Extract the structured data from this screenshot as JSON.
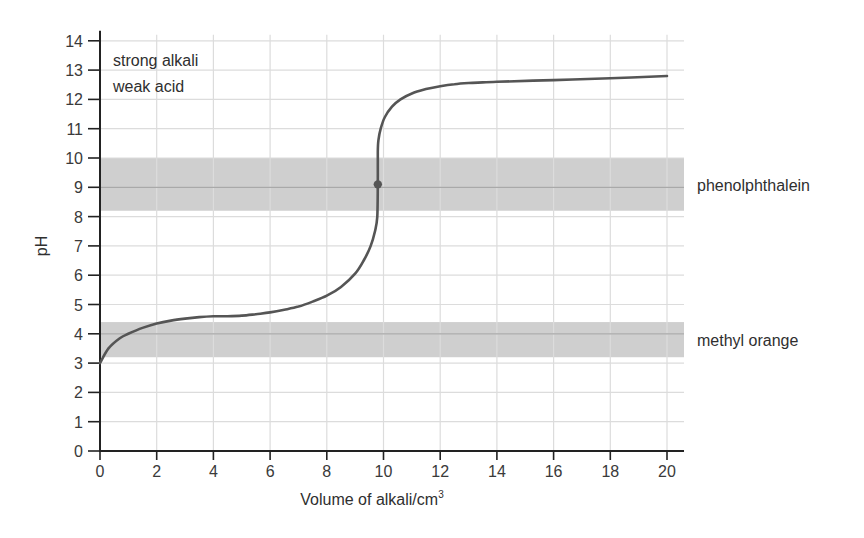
{
  "chart_data": {
    "type": "line",
    "title": "",
    "xlabel": "Volume of alkali/cm",
    "xlabel_superscript": "3",
    "ylabel": "pH",
    "xlim": [
      0,
      20.6
    ],
    "ylim": [
      0,
      14
    ],
    "grid": true,
    "x_ticks": [
      0,
      2,
      4,
      6,
      8,
      10,
      12,
      14,
      16,
      18,
      20
    ],
    "y_ticks": [
      0,
      1,
      2,
      3,
      4,
      5,
      6,
      7,
      8,
      9,
      10,
      11,
      12,
      13,
      14
    ],
    "annotation_lines": [
      "strong alkali",
      "weak acid"
    ],
    "series": [
      {
        "name": "titration curve",
        "color": "#555555",
        "x": [
          0,
          0.3,
          0.7,
          1,
          1.5,
          2,
          2.5,
          3,
          3.5,
          4,
          4.5,
          5,
          5.5,
          6,
          6.5,
          7,
          7.5,
          8,
          8.5,
          9,
          9.3,
          9.55,
          9.7,
          9.78,
          9.8,
          9.8,
          9.82,
          9.9,
          10.05,
          10.3,
          10.6,
          11,
          11.5,
          12,
          12.5,
          13,
          13.5,
          14,
          16,
          18,
          20
        ],
        "y": [
          3.0,
          3.5,
          3.85,
          4.0,
          4.2,
          4.35,
          4.45,
          4.52,
          4.57,
          4.6,
          4.6,
          4.62,
          4.67,
          4.73,
          4.82,
          4.93,
          5.1,
          5.3,
          5.6,
          6.05,
          6.5,
          7.0,
          7.5,
          8.0,
          9.1,
          10.2,
          10.6,
          11.0,
          11.4,
          11.75,
          12.0,
          12.2,
          12.35,
          12.45,
          12.52,
          12.56,
          12.58,
          12.6,
          12.66,
          12.72,
          12.8
        ]
      }
    ],
    "marked_point": {
      "x": 9.8,
      "y": 9.1,
      "label": "equivalence point"
    },
    "bands": [
      {
        "name": "phenolphthalein",
        "label": "phenolphthalein",
        "y_min": 8.2,
        "y_max": 10.0,
        "midline": 9.0,
        "color": "#cfcfcf"
      },
      {
        "name": "methyl orange",
        "label": "methyl orange",
        "y_min": 3.2,
        "y_max": 4.4,
        "midline": 4.0,
        "color": "#cfcfcf"
      }
    ],
    "colors": {
      "grid": "#dcdcdc",
      "axis": "#222222",
      "band_line": "#a9a9a9",
      "curve": "#555555"
    }
  }
}
